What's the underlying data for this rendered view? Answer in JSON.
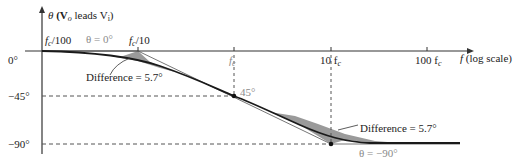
{
  "diagram": {
    "y_axis_label": {
      "theta": "θ",
      "rest": " (V",
      "sub_o": "o",
      "mid": " leads V",
      "sub_i": "i",
      "end": ")"
    },
    "x_axis_label": {
      "f": "f",
      "rest": " (log scale)"
    },
    "y_ticks": [
      "0°",
      "−45°",
      "−90°"
    ],
    "x_ticks": [
      {
        "pre": "f",
        "sub": "c",
        "post": "/100"
      },
      {
        "pre": "f",
        "sub": "c",
        "post": "/10"
      },
      {
        "pre": "f",
        "sub": "c",
        "post": ""
      },
      {
        "pre": "10 f",
        "sub": "c",
        "post": ""
      },
      {
        "pre": "100 f",
        "sub": "c",
        "post": ""
      }
    ],
    "annotations": {
      "theta_zero": "θ = 0°",
      "theta_minus90": "θ = −90°",
      "mid_point": "45°",
      "difference_left": "Difference = 5.7°",
      "difference_right": "Difference = 5.7°"
    },
    "colors": {
      "curve": "#1a1a1a",
      "shade": "#9a9a9a",
      "axis": "#333333",
      "dashed": "#555555",
      "gray_text": "#8a8a8a"
    }
  }
}
